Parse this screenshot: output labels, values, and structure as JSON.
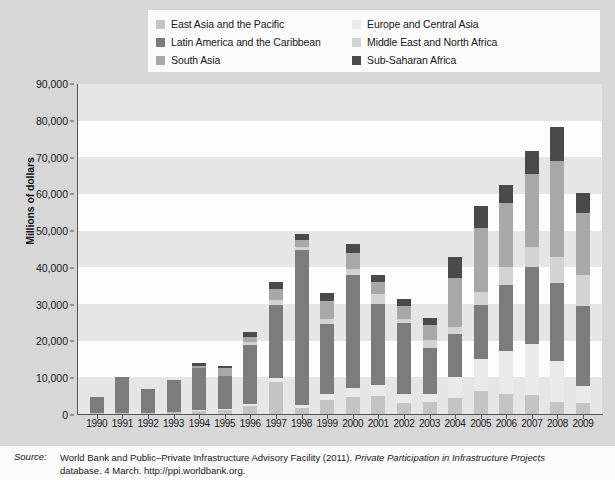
{
  "legend": {
    "items": [
      {
        "label": "East Asia and the Pacific",
        "color": "#c4c4c4",
        "key": "east_asia_pacific"
      },
      {
        "label": "Europe and Central Asia",
        "color": "#eaeaea",
        "key": "europe_central_asia"
      },
      {
        "label": "Latin America and the Caribbean",
        "color": "#7c7c7c",
        "key": "latin_america_caribbean"
      },
      {
        "label": "Middle East and North Africa",
        "color": "#d3d3d3",
        "key": "middle_east_north_africa"
      },
      {
        "label": "South Asia",
        "color": "#a8a8a8",
        "key": "south_asia"
      },
      {
        "label": "Sub-Saharan Africa",
        "color": "#4a4a4a",
        "key": "sub_saharan_africa"
      }
    ]
  },
  "axes": {
    "y_title": "Millions of dollars",
    "y_ticks": [
      "0",
      "10,000",
      "20,000",
      "30,000",
      "40,000",
      "50,000",
      "60,000",
      "70,000",
      "80,000",
      "90,000"
    ]
  },
  "source": {
    "label": "Source:",
    "line1_plain_a": "World Bank and Public–Private Infrastructure Advisory Facility (2011). ",
    "line1_italic": "Private Participation in Infrastructure Projects",
    "line2_plain": "database. 4 March. http://ppi.worldbank.org."
  },
  "chart_data": {
    "type": "bar",
    "stacked": true,
    "title": "",
    "xlabel": "",
    "ylabel": "Millions of dollars",
    "ylim": [
      0,
      90000
    ],
    "ytick_step": 10000,
    "grid": "horizontal-bands",
    "legend_position": "top",
    "categories": [
      "1990",
      "1991",
      "1992",
      "1993",
      "1994",
      "1995",
      "1996",
      "1997",
      "1998",
      "1999",
      "2000",
      "2001",
      "2002",
      "2003",
      "2004",
      "2005",
      "2006",
      "2007",
      "2008",
      "2009"
    ],
    "series": [
      {
        "name": "East Asia and the Pacific",
        "color": "#c4c4c4",
        "values": [
          300,
          300,
          400,
          500,
          800,
          1000,
          2200,
          8700,
          1600,
          3700,
          4700,
          4900,
          3000,
          3200,
          4500,
          6200,
          5500,
          5200,
          3200,
          3100
        ]
      },
      {
        "name": "Europe and Central Asia",
        "color": "#eaeaea",
        "values": [
          0,
          0,
          0,
          0,
          200,
          300,
          600,
          1100,
          900,
          1800,
          2500,
          3000,
          2500,
          2200,
          5500,
          8800,
          11600,
          13800,
          11200,
          4500
        ]
      },
      {
        "name": "Latin America and the Caribbean",
        "color": "#7c7c7c",
        "values": [
          4300,
          9700,
          6400,
          8700,
          11500,
          9200,
          16000,
          19800,
          42200,
          19100,
          30800,
          22100,
          19200,
          12500,
          11700,
          14800,
          18000,
          21000,
          21400,
          21800
        ]
      },
      {
        "name": "Middle East and North Africa",
        "color": "#d3d3d3",
        "values": [
          0,
          0,
          0,
          0,
          0,
          0,
          800,
          1500,
          900,
          1400,
          1500,
          2600,
          1200,
          2300,
          2100,
          3500,
          4900,
          5500,
          7000,
          8400
        ]
      },
      {
        "name": "South Asia",
        "color": "#a8a8a8",
        "values": [
          0,
          0,
          0,
          0,
          600,
          2000,
          1500,
          3000,
          2000,
          4900,
          4400,
          3300,
          3500,
          4100,
          13400,
          17500,
          17500,
          19900,
          26200,
          17100
        ]
      },
      {
        "name": "Sub-Saharan Africa",
        "color": "#4a4a4a",
        "values": [
          0,
          0,
          0,
          0,
          700,
          700,
          1300,
          1800,
          1600,
          2200,
          2600,
          2000,
          2000,
          1900,
          5700,
          6000,
          5000,
          6300,
          9400,
          5300
        ]
      }
    ],
    "totals": [
      4600,
      10000,
      6800,
      9200,
      13800,
      13200,
      22400,
      35900,
      49200,
      33100,
      46500,
      37900,
      31400,
      26200,
      42900,
      56800,
      62500,
      71700,
      78400,
      60200
    ]
  }
}
